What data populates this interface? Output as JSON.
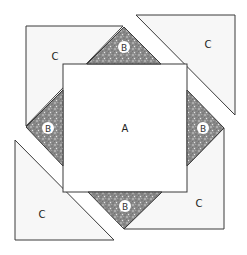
{
  "diagram": {
    "colors": {
      "outline": "#3a3a3a",
      "piece_c_fill": "#f7f7f7",
      "piece_a_fill": "#ffffff",
      "piece_b_fill": "#8c8c8c",
      "label_badge_fill": "#ffffff"
    },
    "pieces": {
      "a": {
        "label": "A"
      },
      "b_top": {
        "label": "B"
      },
      "b_right": {
        "label": "B"
      },
      "b_bottom": {
        "label": "B"
      },
      "b_left": {
        "label": "B"
      },
      "c_top_left": {
        "label": "C"
      },
      "c_top_right": {
        "label": "C"
      },
      "c_bottom_left": {
        "label": "C"
      },
      "c_bottom_right": {
        "label": "C"
      }
    }
  }
}
